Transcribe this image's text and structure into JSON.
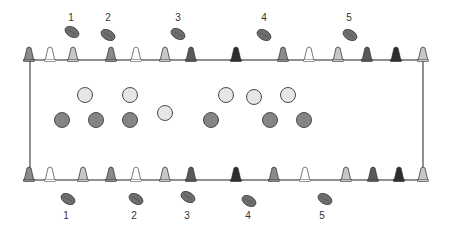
{
  "diagram": {
    "field": {
      "x1": 30,
      "y1": 60,
      "x2": 423,
      "y2": 180,
      "stroke": "#555555"
    },
    "cone_colors": {
      "white": "#ffffff",
      "light": "#c8c8c8",
      "mid": "#8a8a8a",
      "dark": "#5a5a5a",
      "black": "#2e2e2e"
    },
    "top_cones": [
      {
        "x": 29,
        "color": "mid"
      },
      {
        "x": 50,
        "color": "white"
      },
      {
        "x": 73,
        "color": "light"
      },
      {
        "x": 111,
        "color": "mid"
      },
      {
        "x": 136,
        "color": "white"
      },
      {
        "x": 165,
        "color": "light"
      },
      {
        "x": 191,
        "color": "dark"
      },
      {
        "x": 236,
        "color": "black"
      },
      {
        "x": 283,
        "color": "mid"
      },
      {
        "x": 309,
        "color": "white"
      },
      {
        "x": 338,
        "color": "light"
      },
      {
        "x": 367,
        "color": "dark"
      },
      {
        "x": 396,
        "color": "black"
      },
      {
        "x": 423,
        "color": "light"
      }
    ],
    "bottom_cones": [
      {
        "x": 29,
        "color": "mid"
      },
      {
        "x": 50,
        "color": "white"
      },
      {
        "x": 83,
        "color": "light"
      },
      {
        "x": 111,
        "color": "mid"
      },
      {
        "x": 136,
        "color": "white"
      },
      {
        "x": 165,
        "color": "light"
      },
      {
        "x": 191,
        "color": "dark"
      },
      {
        "x": 236,
        "color": "black"
      },
      {
        "x": 274,
        "color": "mid"
      },
      {
        "x": 305,
        "color": "white"
      },
      {
        "x": 346,
        "color": "light"
      },
      {
        "x": 373,
        "color": "dark"
      },
      {
        "x": 399,
        "color": "black"
      },
      {
        "x": 423,
        "color": "light"
      }
    ],
    "light_players": [
      {
        "x": 85,
        "y": 95
      },
      {
        "x": 130,
        "y": 95
      },
      {
        "x": 165,
        "y": 113
      },
      {
        "x": 226,
        "y": 95
      },
      {
        "x": 254,
        "y": 97
      },
      {
        "x": 288,
        "y": 95
      }
    ],
    "dark_players": [
      {
        "x": 62,
        "y": 120
      },
      {
        "x": 96,
        "y": 120
      },
      {
        "x": 130,
        "y": 120
      },
      {
        "x": 211,
        "y": 120
      },
      {
        "x": 270,
        "y": 120
      },
      {
        "x": 304,
        "y": 120
      }
    ],
    "player_colors": {
      "light": "#e6e6e6",
      "dark": "#858585",
      "stroke": "#4a4a4a"
    },
    "top_balls": [
      {
        "label": "1",
        "x": 72,
        "y": 32,
        "lx": 71,
        "ly": 21
      },
      {
        "label": "2",
        "x": 108,
        "y": 35,
        "lx": 108,
        "ly": 21
      },
      {
        "label": "3",
        "x": 178,
        "y": 34,
        "lx": 178,
        "ly": 21
      },
      {
        "label": "4",
        "x": 264,
        "y": 35,
        "lx": 264,
        "ly": 21
      },
      {
        "label": "5",
        "x": 350,
        "y": 35,
        "lx": 349,
        "ly": 21
      }
    ],
    "bottom_balls": [
      {
        "label": "1",
        "x": 68,
        "y": 199,
        "lx": 66,
        "ly": 219
      },
      {
        "label": "2",
        "x": 136,
        "y": 199,
        "lx": 134,
        "ly": 219
      },
      {
        "label": "3",
        "x": 188,
        "y": 197,
        "lx": 187,
        "ly": 219
      },
      {
        "label": "4",
        "x": 249,
        "y": 201,
        "lx": 248,
        "ly": 219
      },
      {
        "label": "5",
        "x": 325,
        "y": 199,
        "lx": 322,
        "ly": 219
      }
    ],
    "ball_color": "#6e6e6e"
  }
}
